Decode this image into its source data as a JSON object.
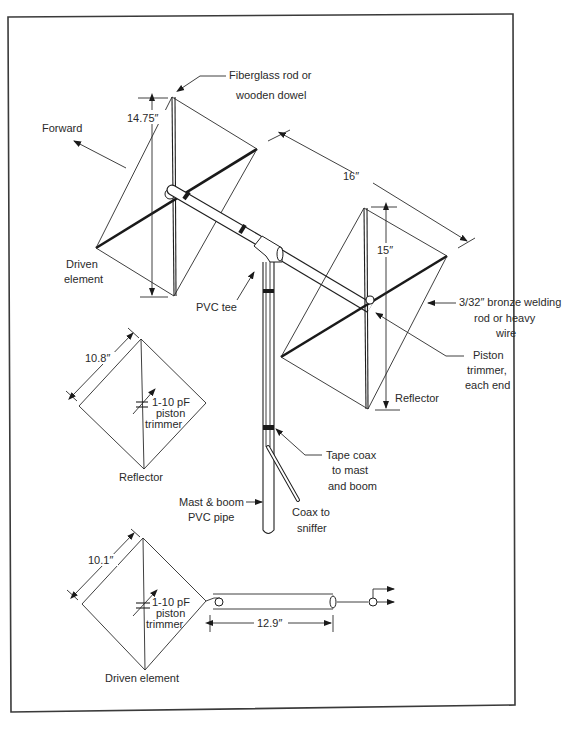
{
  "figure": {
    "colors": {
      "ink": "#1f1f1f",
      "background": "#ffffff",
      "frame": "#3a3a3a"
    }
  },
  "main_view": {
    "labels": {
      "fiberglass_line1": "Fiberglass rod or",
      "fiberglass_line2": "wooden dowel",
      "forward": "Forward",
      "driven_line1": "Driven",
      "driven_line2": "element",
      "pvc_tee": "PVC tee",
      "bronze_line1": "3/32″ bronze welding",
      "bronze_line2": "rod or heavy",
      "bronze_line3": "wire",
      "piston_line1": "Piston",
      "piston_line2": "trimmer,",
      "piston_line3": "each end",
      "reflector": "Reflector",
      "tape_line1": "Tape coax",
      "tape_line2": "to mast",
      "tape_line3": "and boom",
      "mast_line1": "Mast & boom",
      "mast_line2": "PVC pipe",
      "coax_line1": "Coax to",
      "coax_line2": "sniffer"
    },
    "dimensions": {
      "driven_height": "14.75″",
      "boom_spacing": "16″",
      "reflector_height": "15″"
    }
  },
  "reflector_schematic": {
    "side_dimension": "10.8″",
    "cap_line1": "1-10 pF",
    "cap_line2": "piston",
    "cap_line3": "trimmer",
    "caption": "Reflector"
  },
  "driven_schematic": {
    "side_dimension": "10.1″",
    "cap_line1": "1-10 pF",
    "cap_line2": "piston",
    "cap_line3": "trimmer",
    "caption": "Driven element",
    "feedline_length": "12.9″"
  }
}
